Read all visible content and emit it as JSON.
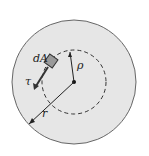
{
  "diagram": {
    "labels": {
      "dA": "dA",
      "rho": "ρ",
      "tau": "τ",
      "r": "r"
    },
    "colors": {
      "disk_fill": "#e6e6e6",
      "outline": "#555555",
      "element_fill": "#9a9a9a",
      "line": "#222222"
    }
  }
}
